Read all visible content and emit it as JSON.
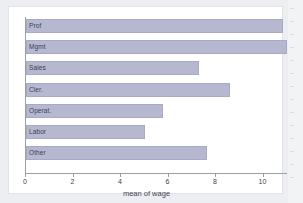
{
  "chart_data": {
    "type": "bar",
    "orientation": "horizontal",
    "title": "",
    "xlabel": "mean of wage",
    "ylabel": "",
    "categories": [
      "Prof",
      "Mgmt",
      "Sales",
      "Cler.",
      "Operat.",
      "Labor",
      "Other"
    ],
    "values": [
      10.8,
      11.0,
      7.3,
      8.6,
      5.75,
      5.0,
      7.6
    ],
    "xlim": [
      0,
      11.2
    ],
    "xticks": [
      0,
      2,
      4,
      6,
      8,
      10
    ],
    "xtick_labels": [
      "0",
      "2",
      "4",
      "6",
      "8",
      "10"
    ],
    "grid": false,
    "legend": false,
    "bar_color": "#b6b8cf",
    "bar_border_color": "#a8aac4",
    "label_color": "#3a3f55",
    "axis_color": "#9aa0a8",
    "plot_background": "#ffffff",
    "figure_background": "#eceef1"
  }
}
